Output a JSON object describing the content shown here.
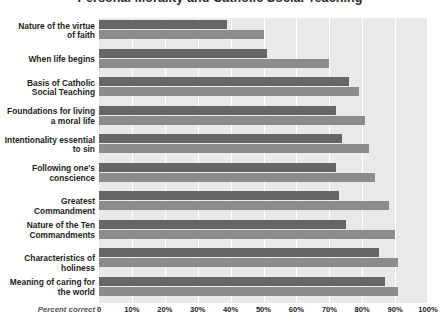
{
  "chart_data": {
    "type": "bar",
    "orientation": "horizontal",
    "title": "Personal Morality and Catholic Social Teaching",
    "xlabel": "Percent correct",
    "ylabel": "",
    "xlim": [
      0,
      100
    ],
    "grid": true,
    "legend_position": "none",
    "tick_labels": [
      "0",
      "10%",
      "20%",
      "30%",
      "40%",
      "50%",
      "60%",
      "70%",
      "80%",
      "90%",
      "100%"
    ],
    "tick_values": [
      0,
      10,
      20,
      30,
      40,
      50,
      60,
      70,
      80,
      90,
      100
    ],
    "categories": [
      "Nature of the virtue of faith",
      "When life begins",
      "Basis of Catholic Social Teaching",
      "Foundations for living a moral life",
      "Intentionality essential to sin",
      "Following one's conscience",
      "Greatest Commandment",
      "Nature of the Ten Commandments",
      "Characteristics of holiness",
      "Meaning of caring for the world"
    ],
    "category_lines": [
      [
        "Nature of the virtue",
        "of faith"
      ],
      [
        "When life begins"
      ],
      [
        "Basis of Catholic",
        "Social Teaching"
      ],
      [
        "Foundations for living",
        "a moral life"
      ],
      [
        "Intentionality essential",
        "to sin"
      ],
      [
        "Following one's",
        "conscience"
      ],
      [
        "Greatest Commandment"
      ],
      [
        "Nature of the Ten",
        "Commandments"
      ],
      [
        "Characteristics of holiness"
      ],
      [
        "Meaning of caring for",
        "the world"
      ]
    ],
    "series": [
      {
        "name": "Series A",
        "color": "#666666",
        "values": [
          39,
          51,
          76,
          72,
          74,
          72,
          73,
          75,
          85,
          87
        ]
      },
      {
        "name": "Series B",
        "color": "#8c8c8c",
        "values": [
          50,
          70,
          79,
          81,
          82,
          84,
          88,
          90,
          91,
          91
        ]
      }
    ]
  },
  "colors": {
    "plot_background": "#e9e9e9",
    "gridline": "#ffffff",
    "page_background": "#ffffff",
    "text": "#1e1e1e",
    "axis_label_text": "#555555"
  }
}
